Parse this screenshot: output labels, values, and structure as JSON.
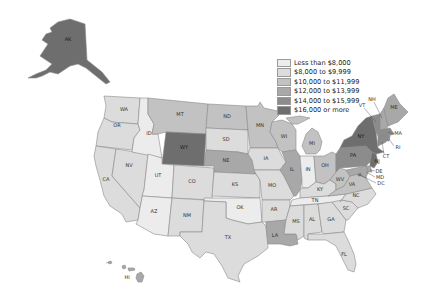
{
  "map": {
    "type": "choropleth",
    "region": "United States",
    "legend": {
      "classes": [
        {
          "label": "Less than $8,000",
          "color": "#ececec"
        },
        {
          "label": "$8,000 to $9,999",
          "color": "#dcdcdc"
        },
        {
          "label": "$10,000 to $11,999",
          "color": "#c2c2c2"
        },
        {
          "label": "$12,000 to $13,999",
          "color": "#a8a8a8"
        },
        {
          "label": "$14,000 to $15,999",
          "color": "#8c8c8c"
        },
        {
          "label": "$16,000 or more",
          "color": "#6e6e6e"
        }
      ]
    },
    "states": {
      "AK": {
        "label": "AK",
        "class": 5
      },
      "HI": {
        "label": "HI",
        "class": 3
      },
      "WA": {
        "label": "WA",
        "class": 1
      },
      "OR": {
        "label": "OR",
        "class": 1
      },
      "CA": {
        "label": "CA",
        "class": 1
      },
      "NV": {
        "label": "NV",
        "class": 1
      },
      "ID": {
        "label": "ID",
        "class": 0
      },
      "MT": {
        "label": "MT",
        "class": 2
      },
      "WY": {
        "label": "WY",
        "class": 5
      },
      "UT": {
        "label": "UT",
        "class": 0
      },
      "CO": {
        "label": "CO",
        "class": 1
      },
      "AZ": {
        "label": "AZ",
        "class": 0
      },
      "NM": {
        "label": "NM",
        "class": 1
      },
      "ND": {
        "label": "ND",
        "class": 2
      },
      "SD": {
        "label": "SD",
        "class": 1
      },
      "NE": {
        "label": "NE",
        "class": 3
      },
      "KS": {
        "label": "KS",
        "class": 1
      },
      "OK": {
        "label": "OK",
        "class": 0
      },
      "TX": {
        "label": "TX",
        "class": 1
      },
      "MN": {
        "label": "MN",
        "class": 2
      },
      "IA": {
        "label": "IA",
        "class": 1
      },
      "MO": {
        "label": "MO",
        "class": 1
      },
      "AR": {
        "label": "AR",
        "class": 1
      },
      "LA": {
        "label": "LA",
        "class": 3
      },
      "WI": {
        "label": "WI",
        "class": 2
      },
      "IL": {
        "label": "IL",
        "class": 3
      },
      "MI": {
        "label": "MI",
        "class": 2
      },
      "IN": {
        "label": "IN",
        "class": 0
      },
      "OH": {
        "label": "OH",
        "class": 2
      },
      "KY": {
        "label": "KY",
        "class": 1
      },
      "TN": {
        "label": "TN",
        "class": 0
      },
      "MS": {
        "label": "MS",
        "class": 1
      },
      "AL": {
        "label": "AL",
        "class": 1
      },
      "GA": {
        "label": "GA",
        "class": 1
      },
      "FL": {
        "label": "FL",
        "class": 1
      },
      "SC": {
        "label": "SC",
        "class": 1
      },
      "NC": {
        "label": "NC",
        "class": 1
      },
      "VA": {
        "label": "VA",
        "class": 2
      },
      "WV": {
        "label": "WV",
        "class": 2
      },
      "PA": {
        "label": "PA",
        "class": 4
      },
      "NY": {
        "label": "NY",
        "class": 5
      },
      "VT": {
        "label": "VT",
        "class": 4
      },
      "NH": {
        "label": "NH",
        "class": 3
      },
      "ME": {
        "label": "ME",
        "class": 3
      },
      "MA": {
        "label": "MA",
        "class": 4
      },
      "RI": {
        "label": "RI",
        "class": 4
      },
      "CT": {
        "label": "CT",
        "class": 4
      },
      "NJ": {
        "label": "NJ",
        "class": 5
      },
      "DE": {
        "label": "DE",
        "class": 3
      },
      "MD": {
        "label": "MD",
        "class": 3
      },
      "DC": {
        "label": "DC",
        "class": 5
      }
    }
  }
}
